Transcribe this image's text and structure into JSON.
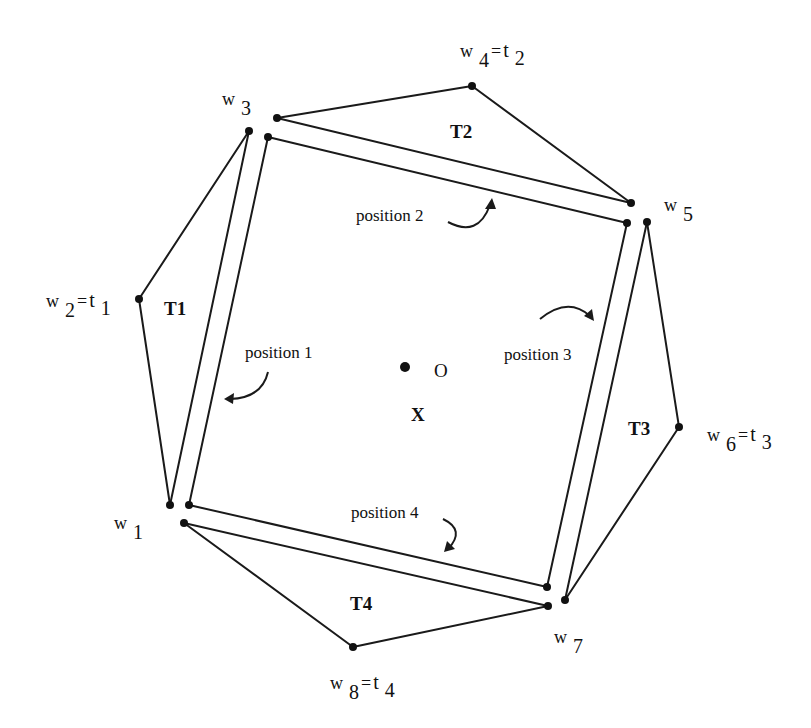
{
  "diagram": {
    "colors": {
      "line": "#1a1a1a",
      "background": "#ffffff"
    },
    "vertices": {
      "w1": {
        "label": "w",
        "sub": "1"
      },
      "w2": {
        "label": "w",
        "sub": "2",
        "eq": "=",
        "t": "t",
        "tsub": "1"
      },
      "w3": {
        "label": "w",
        "sub": "3"
      },
      "w4": {
        "label": "w",
        "sub": "4",
        "eq": "=",
        "t": "t",
        "tsub": "2"
      },
      "w5": {
        "label": "w",
        "sub": "5"
      },
      "w6": {
        "label": "w",
        "sub": "6",
        "eq": "=",
        "t": "t",
        "tsub": "3"
      },
      "w7": {
        "label": "w",
        "sub": "7"
      },
      "w8": {
        "label": "w",
        "sub": "8",
        "eq": "=",
        "t": "t",
        "tsub": "4"
      }
    },
    "triangles": [
      "T1",
      "T2",
      "T3",
      "T4"
    ],
    "positions": [
      "position 1",
      "position 2",
      "position 3",
      "position 4"
    ],
    "center": {
      "point_label": "O",
      "region_label": "X"
    }
  }
}
